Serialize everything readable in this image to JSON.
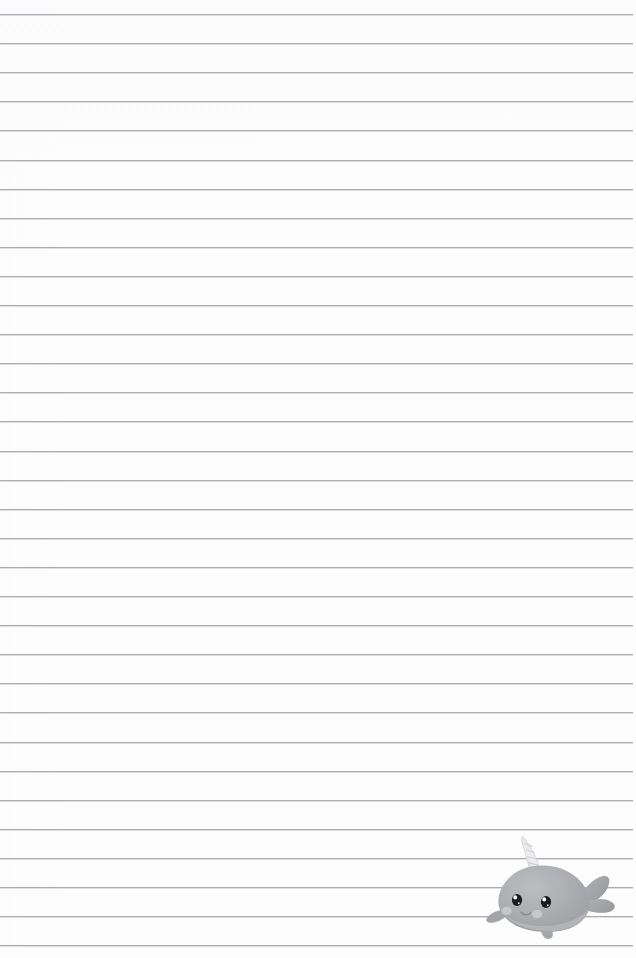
{
  "page": {
    "kind": "lined-notebook-paper",
    "width": 636,
    "height": 958,
    "background_color": "#fdfdfd",
    "title": "",
    "body_text": ""
  },
  "ruled_lines": {
    "count": 33,
    "first_line_y": 14,
    "spacing": 29.1,
    "left_x": 0,
    "right_x": 633,
    "color": "#9fa0a4",
    "secondary_color": "#d8d9dc",
    "thickness": 1
  },
  "illustration": {
    "name": "narwhal",
    "label": "narwhal",
    "position": {
      "left": 483,
      "top": 832,
      "width": 136,
      "height": 110
    },
    "colors": {
      "body": "#a9aaae",
      "body_shadow": "#9a9b9f",
      "body_light": "#b8b9bd",
      "belly": "#c3c4c8",
      "horn": "#e4e5e8",
      "horn_shade": "#cfd0d4",
      "eye": "#1b1b1d",
      "eye_highlight": "#ffffff",
      "cheek": "#c9cacd",
      "mouth": "#8d8e92"
    },
    "parts": [
      "horn",
      "head",
      "body",
      "tail-fin",
      "side-flipper",
      "left-eye",
      "right-eye",
      "left-cheek",
      "right-cheek",
      "mouth",
      "bottom-fin"
    ]
  }
}
